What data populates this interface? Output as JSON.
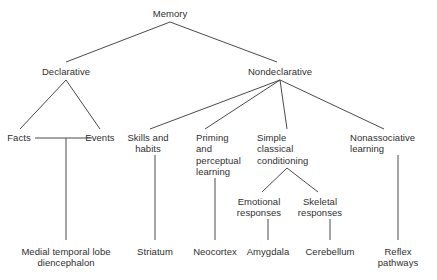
{
  "diagram": {
    "type": "tree",
    "line_color": "#4a4a4a",
    "text_color": "#2f2f2f",
    "background": "#ffffff",
    "nodes": [
      {
        "id": "memory",
        "label": "Memory",
        "x": 170,
        "y": 8,
        "align": "center",
        "level": 0
      },
      {
        "id": "declarative",
        "label": "Declarative",
        "x": 66,
        "y": 66,
        "align": "center",
        "level": 1
      },
      {
        "id": "nondeclarative",
        "label": "Nondeclarative",
        "x": 280,
        "y": 66,
        "align": "center",
        "level": 1
      },
      {
        "id": "facts",
        "label": "Facts",
        "x": 19,
        "y": 132,
        "align": "center",
        "level": 2
      },
      {
        "id": "events",
        "label": "Events",
        "x": 100,
        "y": 132,
        "align": "center",
        "level": 2
      },
      {
        "id": "skills",
        "label": "Skills and\nhabits",
        "x": 148,
        "y": 132,
        "align": "center",
        "level": 2
      },
      {
        "id": "priming",
        "label": "Priming\nand\nperceptual\nlearning",
        "x": 196,
        "y": 132,
        "align": "left",
        "level": 2
      },
      {
        "id": "simple",
        "label": "Simple\nclassical\nconditioning",
        "x": 257,
        "y": 132,
        "align": "left",
        "level": 2
      },
      {
        "id": "nonassociative",
        "label": "Nonassociative\nlearning",
        "x": 350,
        "y": 132,
        "align": "left",
        "level": 2
      },
      {
        "id": "emotional",
        "label": "Emotional\nresponses",
        "x": 259,
        "y": 196,
        "align": "center",
        "level": 3
      },
      {
        "id": "skeletal",
        "label": "Skeletal\nresponses",
        "x": 320,
        "y": 196,
        "align": "center",
        "level": 3
      },
      {
        "id": "mtl",
        "label": "Medial temporal lobe\ndiencephalon",
        "x": 66,
        "y": 246,
        "align": "center",
        "level": 4
      },
      {
        "id": "striatum",
        "label": "Striatum",
        "x": 155,
        "y": 246,
        "align": "center",
        "level": 4
      },
      {
        "id": "neocortex",
        "label": "Neocortex",
        "x": 215,
        "y": 246,
        "align": "center",
        "level": 4
      },
      {
        "id": "amygdala",
        "label": "Amygdala",
        "x": 268,
        "y": 246,
        "align": "center",
        "level": 4
      },
      {
        "id": "cerebellum",
        "label": "Cerebellum",
        "x": 330,
        "y": 246,
        "align": "center",
        "level": 4
      },
      {
        "id": "reflex",
        "label": "Reflex\npathways",
        "x": 398,
        "y": 246,
        "align": "center",
        "level": 4
      }
    ],
    "edges": [
      {
        "from": "memory",
        "to": "declarative",
        "d": "M170,22 L66,62"
      },
      {
        "from": "memory",
        "to": "nondeclarative",
        "d": "M170,22 L277,62"
      },
      {
        "from": "declarative",
        "to": "facts",
        "d": "M66,80 L20,129"
      },
      {
        "from": "declarative",
        "to": "events",
        "d": "M66,80 L100,129"
      },
      {
        "from": "facts",
        "to": "events",
        "d": "M35,138 L92,138"
      },
      {
        "from": "factsevents",
        "to": "mtl",
        "d": "M66,138 L66,240"
      },
      {
        "from": "nondeclarative",
        "to": "skills",
        "d": "M280,80 L150,129"
      },
      {
        "from": "nondeclarative",
        "to": "priming",
        "d": "M280,80 L205,129"
      },
      {
        "from": "nondeclarative",
        "to": "simple",
        "d": "M280,80 L287,129"
      },
      {
        "from": "nondeclarative",
        "to": "nonassociative",
        "d": "M280,80 L384,129"
      },
      {
        "from": "skills",
        "to": "striatum",
        "d": "M155,155 L155,240"
      },
      {
        "from": "priming",
        "to": "neocortex",
        "d": "M215,178 L215,240"
      },
      {
        "from": "simple",
        "to": "emotional",
        "d": "M287,168 L262,192"
      },
      {
        "from": "simple",
        "to": "skeletal",
        "d": "M287,168 L318,192"
      },
      {
        "from": "emotional",
        "to": "amygdala",
        "d": "M268,219 L268,240"
      },
      {
        "from": "skeletal",
        "to": "cerebellum",
        "d": "M330,219 L330,240"
      },
      {
        "from": "nonassociative",
        "to": "reflex",
        "d": "M398,155 L398,240"
      }
    ]
  }
}
